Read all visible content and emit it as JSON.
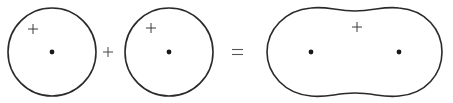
{
  "diagram": {
    "operators": {
      "plus": "+",
      "equals": "="
    },
    "colors": {
      "stroke": "#2a2a2a",
      "dot": "#1a1a1a",
      "background": "#ffffff"
    },
    "shapes": [
      {
        "id": "circle-1",
        "type": "circle",
        "cx": 52,
        "cy": 52,
        "r": 44,
        "center_dot": [
          52,
          52
        ],
        "plus_mark": [
          33,
          29
        ]
      },
      {
        "id": "circle-2",
        "type": "circle",
        "cx": 169,
        "cy": 52,
        "r": 44,
        "center_dot": [
          169,
          52
        ],
        "plus_mark": [
          151,
          28
        ]
      },
      {
        "id": "merged-blob",
        "type": "blob",
        "center_dots": [
          [
            311,
            52
          ],
          [
            399,
            52
          ]
        ],
        "plus_mark": [
          357,
          27
        ]
      }
    ]
  }
}
